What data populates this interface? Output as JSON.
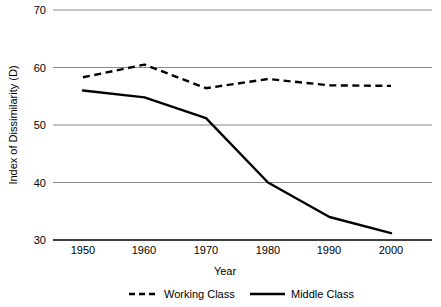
{
  "chart_data": {
    "type": "line",
    "title": "",
    "xlabel": "Year",
    "ylabel": "Index of Dissimilarity (D)",
    "x": [
      1950,
      1960,
      1970,
      1980,
      1990,
      2000
    ],
    "categories": [
      "1950",
      "1960",
      "1970",
      "1980",
      "1990",
      "2000"
    ],
    "xlim": [
      1945,
      2005
    ],
    "ylim": [
      30,
      70
    ],
    "yticks": [
      30,
      40,
      50,
      60,
      70
    ],
    "ytick_labels": [
      "30",
      "40",
      "50",
      "60",
      "70"
    ],
    "xtick_labels": [
      "1950",
      "1960",
      "1970",
      "1980",
      "1990",
      "2000"
    ],
    "grid": "horizontal",
    "legend_position": "bottom",
    "series": [
      {
        "name": "Working Class",
        "style": "dashed",
        "color": "#000000",
        "values": [
          58.3,
          60.5,
          56.4,
          58.0,
          56.9,
          56.8
        ]
      },
      {
        "name": "Middle Class",
        "style": "solid",
        "color": "#000000",
        "values": [
          56.0,
          54.8,
          51.2,
          40.0,
          34.0,
          31.2
        ]
      }
    ]
  },
  "legend": {
    "items": [
      {
        "label": "Working Class",
        "style": "dashed"
      },
      {
        "label": "Middle Class",
        "style": "solid"
      }
    ]
  },
  "axes": {
    "y_title": "Index of Dissimilarity (D)",
    "x_title": "Year"
  },
  "colors": {
    "series": "#000000",
    "gridline": "#808080",
    "axis": "#404040",
    "background": "#ffffff"
  }
}
